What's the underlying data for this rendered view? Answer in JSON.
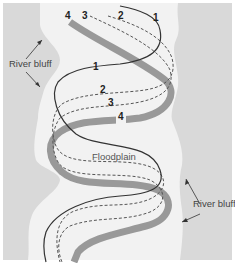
{
  "diagram": {
    "type": "river meander migration",
    "colors": {
      "upland": "#d9d9d9",
      "floodplain": "#f2f2f2",
      "frame": "#ffffff",
      "channel_1": "#333333",
      "channel_2_3": "#555555",
      "channel_4": "#999999"
    },
    "labels": {
      "river_bluff_left": "River bluff",
      "river_bluff_right": "River bluff",
      "floodplain": "Floodplain"
    },
    "channel_labels": {
      "top_4": "4",
      "top_3": "3",
      "top_2": "2",
      "top_1": "1",
      "mid_1": "1",
      "mid_2": "2",
      "mid_3": "3",
      "mid_4": "4"
    },
    "legend": [
      {
        "id": "1",
        "style": "thin solid dark line",
        "meaning": "channel position 1"
      },
      {
        "id": "2",
        "style": "dashed line",
        "meaning": "channel position 2"
      },
      {
        "id": "3",
        "style": "dashed line",
        "meaning": "channel position 3"
      },
      {
        "id": "4",
        "style": "thick gray line",
        "meaning": "channel position 4"
      }
    ]
  }
}
